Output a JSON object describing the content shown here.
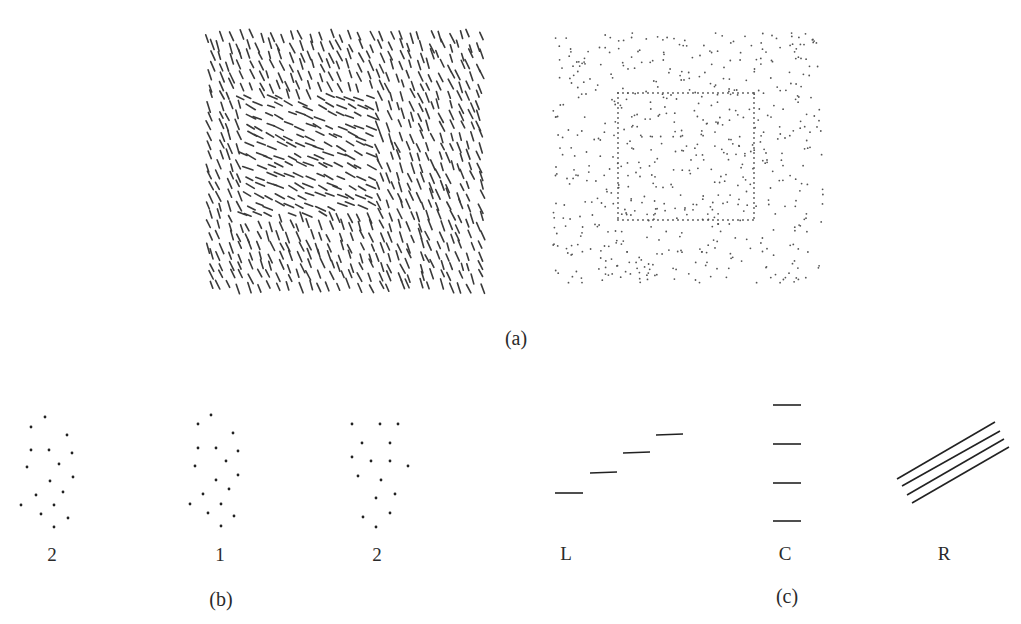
{
  "figure": {
    "part_a": {
      "caption": "(a)",
      "left_texture": {
        "description": "Oriented line segment texture; background segments tilted steeply (~-65deg), inner square region segments tilted shallow (~-25deg)",
        "bbox": [
          207,
          33,
          280,
          258
        ],
        "inner_region": [
          240,
          95,
          135,
          120
        ],
        "background_angle_deg": 112,
        "figure_angle_deg": 155,
        "color": "#3a3a3a"
      },
      "right_texture": {
        "description": "Random dot texture with a square outlined by collinear dots",
        "bbox": [
          553,
          33,
          270,
          250
        ],
        "inner_square": [
          618,
          93,
          136,
          127
        ],
        "color": "#555555"
      }
    },
    "part_b": {
      "caption": "(b)",
      "groups": [
        {
          "label": "2",
          "cx": 50,
          "dots": [
            [
              45,
              17
            ],
            [
              31,
              27
            ],
            [
              67,
              35
            ],
            [
              31,
              50
            ],
            [
              49,
              50
            ],
            [
              72,
              53
            ],
            [
              27,
              67
            ],
            [
              59,
              64
            ],
            [
              73,
              77
            ],
            [
              50,
              81
            ],
            [
              63,
              92
            ],
            [
              36,
              95
            ],
            [
              21,
              105
            ],
            [
              54,
              105
            ],
            [
              41,
              114
            ],
            [
              68,
              118
            ],
            [
              54,
              127
            ]
          ]
        },
        {
          "label": "1",
          "cx": 220,
          "dots": [
            [
              211,
              15
            ],
            [
              198,
              24
            ],
            [
              233,
              33
            ],
            [
              198,
              48
            ],
            [
              216,
              48
            ],
            [
              238,
              51
            ],
            [
              195,
              66
            ],
            [
              226,
              61
            ],
            [
              238,
              75
            ],
            [
              216,
              80
            ],
            [
              229,
              89
            ],
            [
              203,
              94
            ],
            [
              190,
              104
            ],
            [
              221,
              104
            ],
            [
              208,
              113
            ],
            [
              234,
              116
            ],
            [
              221,
              126
            ]
          ]
        },
        {
          "label": "2",
          "cx": 376,
          "dots": [
            [
              352,
              24
            ],
            [
              380,
              24
            ],
            [
              398,
              24
            ],
            [
              362,
              43
            ],
            [
              390,
              43
            ],
            [
              352,
              57
            ],
            [
              371,
              61
            ],
            [
              390,
              61
            ],
            [
              408,
              66
            ],
            [
              358,
              76
            ],
            [
              381,
              80
            ],
            [
              376,
              98
            ],
            [
              395,
              94
            ],
            [
              363,
              117
            ],
            [
              390,
              113
            ],
            [
              376,
              127
            ]
          ]
        }
      ]
    },
    "part_c": {
      "caption": "(c)",
      "groups": [
        {
          "label": "L",
          "segments": [
            [
              555,
              493,
              583,
              493
            ],
            [
              590,
              473,
              617,
              472
            ],
            [
              623,
              453,
              650,
              452
            ],
            [
              656,
              435,
              683,
              434
            ]
          ]
        },
        {
          "label": "C",
          "segments": [
            [
              773,
              405,
              801,
              405
            ],
            [
              773,
              444,
              801,
              444
            ],
            [
              773,
              483,
              801,
              483
            ],
            [
              773,
              521,
              801,
              521
            ]
          ]
        },
        {
          "label": "R",
          "segments": [
            [
              897,
              479,
              995,
              422
            ],
            [
              902,
              486,
              1000,
              431
            ],
            [
              907,
              495,
              1004,
              439
            ],
            [
              912,
              503,
              1009,
              447
            ]
          ]
        }
      ]
    }
  },
  "labels": {
    "a_caption": "(a)",
    "b_caption": "(b)",
    "c_caption": "(c)",
    "b1": "2",
    "b2": "1",
    "b3": "2",
    "cL": "L",
    "cC": "C",
    "cR": "R"
  }
}
